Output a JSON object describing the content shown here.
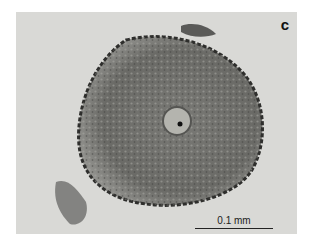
{
  "figure": {
    "panel_label": "c",
    "scale_bar": {
      "label": "0.1 mm"
    },
    "colors": {
      "background": "#d9d9d6",
      "cell": "#6e6e6a",
      "border": "#ffffff"
    }
  }
}
